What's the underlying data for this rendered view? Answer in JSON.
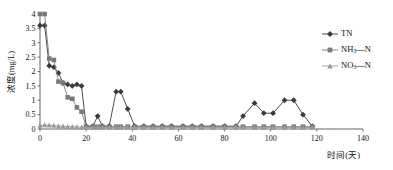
{
  "chart_data": {
    "type": "line",
    "title": "",
    "xlabel": "时间(天)",
    "ylabel": "浓度(mg/L)",
    "xlim": [
      0,
      140
    ],
    "ylim": [
      0,
      4
    ],
    "xticks": [
      0,
      20,
      40,
      60,
      80,
      100,
      120,
      140
    ],
    "xtick_labels": [
      "0",
      "20",
      "40",
      "60",
      "80",
      "100",
      "120",
      "140"
    ],
    "yticks": [
      0,
      0.5,
      1,
      1.5,
      2,
      2.5,
      3,
      3.5,
      4
    ],
    "ytick_labels": [
      "0",
      "0.5",
      "1",
      "1.5",
      "2",
      "2.5",
      "3",
      "3.5",
      "4"
    ],
    "grid": false,
    "legend_position": "right",
    "series": [
      {
        "name": "TN",
        "marker": "diamond",
        "color": "#3a3a3a",
        "x": [
          0,
          2,
          4,
          6,
          8,
          10,
          12,
          14,
          16,
          18,
          20,
          23,
          25,
          27,
          30,
          33,
          35,
          38,
          41,
          45,
          49,
          53,
          57,
          62,
          66,
          70,
          75,
          80,
          85,
          88,
          93,
          97,
          101,
          106,
          110,
          114,
          118
        ],
        "y": [
          3.6,
          3.6,
          2.2,
          2.15,
          1.95,
          1.6,
          1.55,
          1.5,
          1.55,
          1.5,
          0.1,
          0.1,
          0.45,
          0.1,
          0.1,
          1.3,
          1.3,
          0.7,
          0.1,
          0.1,
          0.1,
          0.1,
          0.1,
          0.1,
          0.1,
          0.1,
          0.1,
          0.1,
          0.1,
          0.45,
          0.9,
          0.55,
          0.55,
          1.0,
          1.0,
          0.5,
          0.1
        ]
      },
      {
        "name": "NH₃—N",
        "marker": "square",
        "color": "#7a7a7a",
        "x": [
          0,
          2,
          4,
          6,
          8,
          10,
          12,
          14,
          16,
          18,
          20,
          23,
          25,
          27,
          30,
          33,
          35,
          38,
          41,
          45,
          49,
          53,
          57,
          62,
          66,
          70,
          75,
          80,
          85,
          88,
          93,
          97,
          101,
          106,
          110,
          114,
          118
        ],
        "y": [
          4.0,
          4.0,
          2.45,
          2.4,
          1.65,
          1.6,
          1.1,
          1.05,
          0.75,
          0.6,
          0.08,
          0.08,
          0.08,
          0.08,
          0.08,
          0.08,
          0.08,
          0.08,
          0.08,
          0.08,
          0.08,
          0.08,
          0.08,
          0.08,
          0.08,
          0.08,
          0.08,
          0.08,
          0.08,
          0.08,
          0.08,
          0.08,
          0.08,
          0.08,
          0.08,
          0.08,
          0.08
        ]
      },
      {
        "name": "NO₃—N",
        "marker": "triangle",
        "color": "#9a9a9a",
        "x": [
          0,
          2,
          4,
          6,
          8,
          10,
          12,
          14,
          16,
          18,
          20,
          23,
          25,
          27,
          30,
          33,
          35,
          38,
          41,
          45,
          49,
          53,
          57,
          62,
          66,
          70,
          75,
          80,
          85,
          88,
          93,
          97,
          101,
          106,
          110,
          114,
          118
        ],
        "y": [
          0.12,
          0.14,
          0.13,
          0.12,
          0.1,
          0.1,
          0.08,
          0.08,
          0.07,
          0.06,
          0.05,
          0.05,
          0.05,
          0.05,
          0.05,
          0.05,
          0.05,
          0.05,
          0.05,
          0.05,
          0.05,
          0.05,
          0.05,
          0.05,
          0.05,
          0.05,
          0.05,
          0.05,
          0.05,
          0.05,
          0.05,
          0.05,
          0.05,
          0.05,
          0.05,
          0.05,
          0.05
        ]
      }
    ]
  },
  "legend": {
    "items": [
      {
        "label": "TN",
        "base": "TN",
        "sub": "",
        "tail": "",
        "marker": "diamond",
        "color": "#3a3a3a"
      },
      {
        "label": "NH₃—N",
        "base": "NH",
        "sub": "3",
        "tail": "—N",
        "marker": "square",
        "color": "#7a7a7a"
      },
      {
        "label": "NO₃—N",
        "base": "NO",
        "sub": "3",
        "tail": "—N",
        "marker": "triangle",
        "color": "#9a9a9a"
      }
    ]
  },
  "axes": {
    "x_title": "时间(天)",
    "y_title": "浓度(mg/L)"
  }
}
